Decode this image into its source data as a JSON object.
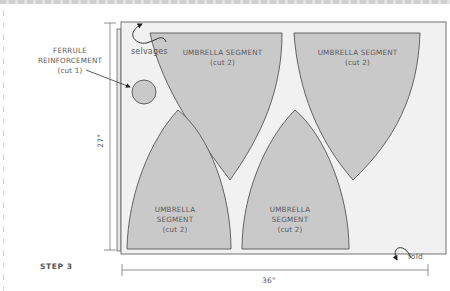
{
  "step_label": "STEP 3",
  "labels": {
    "ferrule_line1": "FERRULE",
    "ferrule_line2": "REINFORCEMENT",
    "ferrule_line3": "(cut 1)",
    "selvages": "selvages",
    "fold": "fold",
    "seg_top_left_line1": "UMBRELLA SEGMENT",
    "seg_top_left_line2": "(cut 2)",
    "seg_top_right_line1": "UMBRELLA SEGMENT",
    "seg_top_right_line2": "(cut 2)",
    "seg_bottom_left_line1": "UMBRELLA",
    "seg_bottom_left_line2": "SEGMENT",
    "seg_bottom_left_line3": "(cut 2)",
    "seg_bottom_right_line1": "UMBRELLA",
    "seg_bottom_right_line2": "SEGMENT",
    "seg_bottom_right_line3": "(cut 2)"
  },
  "dimensions": {
    "height": "27\"",
    "width": "36\""
  },
  "colors": {
    "fabric": "#f1f1f1",
    "piece": "#c9c9c9",
    "outline": "#555555",
    "text": "#5a5a5a"
  }
}
